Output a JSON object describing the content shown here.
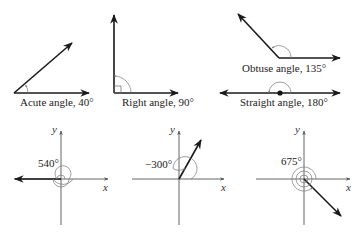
{
  "figure": {
    "top_row": [
      {
        "id": "acute",
        "label": "Acute angle, 40°",
        "degrees": 40
      },
      {
        "id": "right",
        "label": "Right angle, 90°",
        "degrees": 90
      },
      {
        "id": "obtuse",
        "label": "Obtuse angle, 135°",
        "degrees": 135
      },
      {
        "id": "straight",
        "label": "Straight angle, 180°",
        "degrees": 180
      }
    ],
    "bottom_row": [
      {
        "id": "angle-540",
        "label": "540°",
        "degrees": 540,
        "x_axis": "x",
        "y_axis": "y"
      },
      {
        "id": "angle-neg300",
        "label": "−300°",
        "degrees": -300,
        "x_axis": "x",
        "y_axis": "y"
      },
      {
        "id": "angle-675",
        "label": "675°",
        "degrees": 675,
        "x_axis": "x",
        "y_axis": "y"
      }
    ]
  }
}
